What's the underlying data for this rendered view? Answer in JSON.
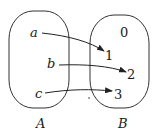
{
  "sets": {
    "A": {
      "label": "A",
      "elements": [
        "a",
        "b",
        "c"
      ]
    },
    "B": {
      "label": "B",
      "elements": [
        "0",
        "1",
        "2",
        "3"
      ]
    }
  },
  "mappings": [
    {
      "from": "a",
      "to": "1"
    },
    {
      "from": "b",
      "to": "2"
    },
    {
      "from": "c",
      "to": "3"
    }
  ],
  "colors": {
    "stroke": "#222222",
    "background": "#ffffff"
  }
}
